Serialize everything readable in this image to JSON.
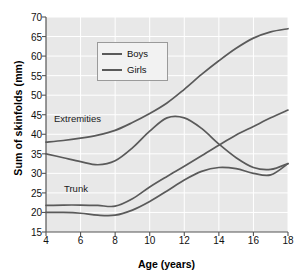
{
  "chart_data": {
    "type": "line",
    "title": "",
    "xlabel": "Age (years)",
    "ylabel": "Sum of skinfolds (mm)",
    "xlim": [
      4,
      18
    ],
    "ylim": [
      15,
      70
    ],
    "xticks": [
      4,
      6,
      8,
      10,
      12,
      14,
      16,
      18
    ],
    "yticks": [
      15,
      20,
      25,
      30,
      35,
      40,
      45,
      50,
      55,
      60,
      65,
      70
    ],
    "grid": true,
    "grid_color": "#ffffff",
    "plot_background": "#e8e8e8",
    "line_color": "#5a5a5a",
    "legend": {
      "position": "upper-center-left",
      "entries": [
        "Boys",
        "Girls"
      ]
    },
    "annotations": [
      {
        "text": "Extremities",
        "x": 5.6,
        "y": 43.5
      },
      {
        "text": "Trunk",
        "x": 6.7,
        "y": 25.5
      }
    ],
    "x": [
      4,
      5,
      6,
      7,
      8,
      9,
      10,
      11,
      12,
      13,
      14,
      15,
      16,
      17,
      18
    ],
    "series": [
      {
        "name": "Girls Extremities",
        "group": "Extremities",
        "sex": "Girls",
        "values": [
          38.0,
          38.4,
          39.0,
          39.8,
          41.0,
          43.0,
          45.3,
          48.0,
          51.5,
          55.3,
          58.8,
          62.0,
          64.6,
          66.2,
          67.0
        ]
      },
      {
        "name": "Boys Extremities",
        "group": "Extremities",
        "sex": "Boys",
        "values": [
          35.0,
          34.0,
          33.0,
          32.2,
          33.2,
          36.5,
          40.8,
          44.2,
          44.2,
          41.5,
          37.5,
          34.0,
          31.5,
          31.0,
          32.5
        ]
      },
      {
        "name": "Girls Trunk",
        "group": "Trunk",
        "sex": "Girls",
        "values": [
          21.8,
          21.9,
          21.9,
          21.8,
          21.6,
          23.5,
          26.5,
          29.2,
          31.8,
          34.5,
          37.2,
          39.8,
          42.0,
          44.2,
          46.2
        ]
      },
      {
        "name": "Boys Trunk",
        "group": "Trunk",
        "sex": "Boys",
        "values": [
          20.0,
          20.0,
          19.8,
          19.3,
          19.3,
          20.6,
          22.8,
          25.5,
          28.3,
          30.5,
          31.5,
          31.2,
          30.0,
          29.6,
          32.5
        ]
      }
    ]
  },
  "axes": {
    "xlabel": "Age (years)",
    "ylabel": "Sum of skinfolds (mm)",
    "xticks": [
      "4",
      "6",
      "8",
      "10",
      "12",
      "14",
      "16",
      "18"
    ],
    "yticks": [
      "70",
      "65",
      "60",
      "55",
      "50",
      "45",
      "40",
      "35",
      "30",
      "25",
      "20",
      "15"
    ]
  },
  "legend": {
    "entries": [
      {
        "label": "Boys",
        "color": "#5a5a5a"
      },
      {
        "label": "Girls",
        "color": "#5a5a5a"
      }
    ]
  },
  "annotations": {
    "extremities": "Extremities",
    "trunk": "Trunk"
  },
  "colors": {
    "line": "#5a5a5a",
    "plot_bg": "#e8e8e8",
    "grid": "#ffffff",
    "axis": "#555555",
    "page_bg": "#ffffff"
  }
}
